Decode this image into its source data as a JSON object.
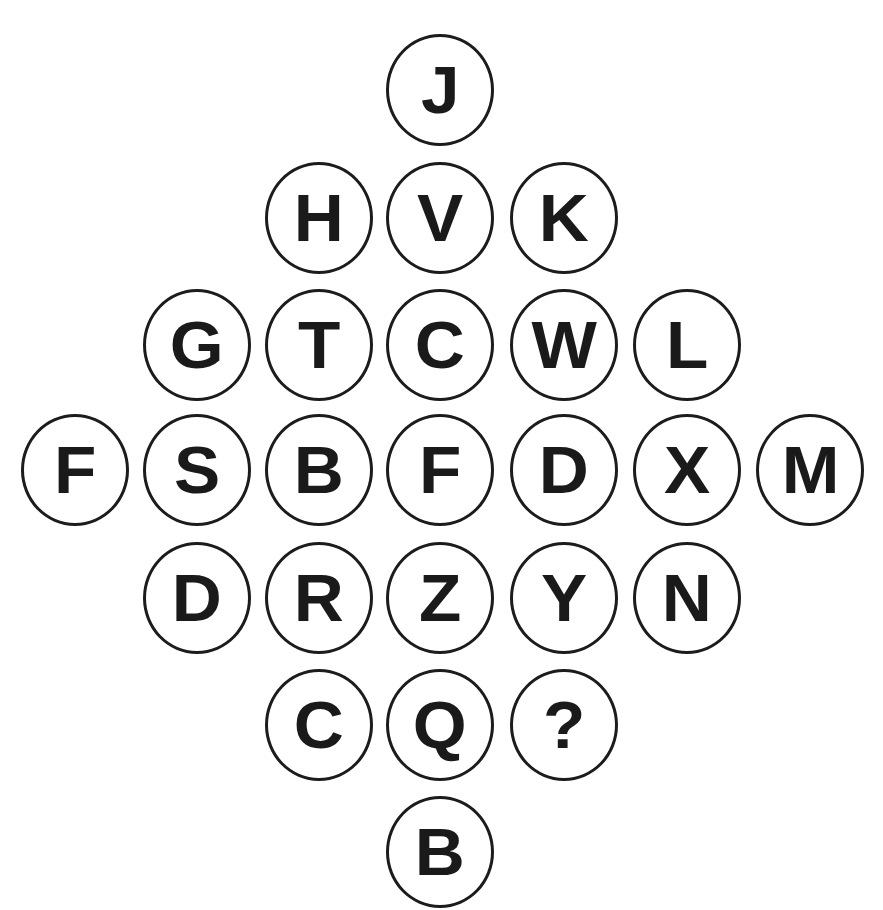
{
  "puzzle": {
    "description": "Diamond arrangement of lettered circles with one missing value",
    "stroke_color": "#1c1c1c",
    "text_color": "#1a1a1a",
    "background": "#ffffff",
    "rows": [
      {
        "row": 1,
        "cells": [
          "J"
        ]
      },
      {
        "row": 2,
        "cells": [
          "H",
          "V",
          "K"
        ]
      },
      {
        "row": 3,
        "cells": [
          "G",
          "T",
          "C",
          "W",
          "L"
        ]
      },
      {
        "row": 4,
        "cells": [
          "F",
          "S",
          "B",
          "F",
          "D",
          "X",
          "M"
        ]
      },
      {
        "row": 5,
        "cells": [
          "D",
          "R",
          "Z",
          "Y",
          "N"
        ]
      },
      {
        "row": 6,
        "cells": [
          "C",
          "Q",
          "?"
        ]
      },
      {
        "row": 7,
        "cells": [
          "B"
        ]
      }
    ],
    "missing_marker": "?"
  }
}
